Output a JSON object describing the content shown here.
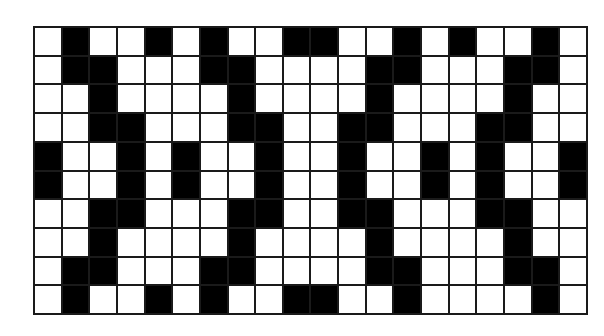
{
  "pattern": {
    "columns": 20,
    "rows": 10,
    "colors": {
      "filled": "#000000",
      "empty": "#ffffff",
      "line": "#1a1a1a"
    },
    "grid": [
      "01001010011001010010",
      "01100011000011000110",
      "00100001000010000100",
      "00110001100110001100",
      "10010100100100101001",
      "10010100100100101001",
      "00110001100110001100",
      "00100001000010000100",
      "01100011000011000110",
      "01001010011001000010"
    ]
  }
}
